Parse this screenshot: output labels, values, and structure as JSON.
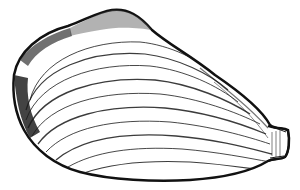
{
  "image": {
    "subject": "clam shell line drawing",
    "style": "black ink stipple illustration on white",
    "background": "#ffffff",
    "ink": "#111111"
  }
}
